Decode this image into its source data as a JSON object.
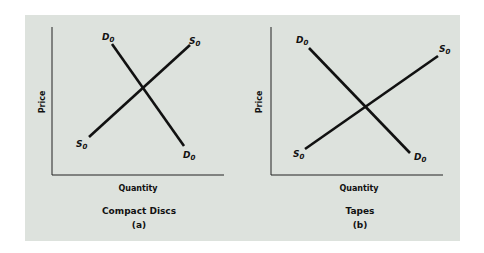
{
  "colors": {
    "background": "#dde2dd",
    "line": "#111111"
  },
  "panels": [
    {
      "id": "a",
      "y_axis_label": "Price",
      "x_axis_label": "Quantity",
      "title": "Compact Discs",
      "letter": "(a)",
      "curves": [
        {
          "name": "D0",
          "label": "D",
          "sub": "0",
          "type": "demand"
        },
        {
          "name": "S0",
          "label": "S",
          "sub": "0",
          "type": "supply"
        }
      ]
    },
    {
      "id": "b",
      "y_axis_label": "Price",
      "x_axis_label": "Quantity",
      "title": "Tapes",
      "letter": "(b)",
      "curves": [
        {
          "name": "D0",
          "label": "D",
          "sub": "0",
          "type": "demand"
        },
        {
          "name": "S0",
          "label": "S",
          "sub": "0",
          "type": "supply"
        }
      ]
    }
  ]
}
